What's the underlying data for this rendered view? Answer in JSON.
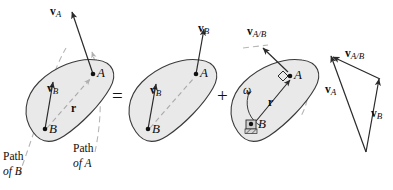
{
  "figure": {
    "background_color": "#ffffff",
    "body_fill_color": "#e9e9e9",
    "body_stroke_color": "#3a3a3a",
    "vector_color": "#2a2a2a",
    "dashed_guide_color": "#b6b6b6"
  },
  "operators": {
    "equals": "=",
    "plus": "+"
  },
  "panels": {
    "general_plane_motion": {
      "name": "general-plane-motion",
      "points": {
        "a_label": "A",
        "b_label": "B"
      },
      "vectors": {
        "v_a": {
          "symbol": "v",
          "subscript": "A"
        },
        "v_b": {
          "symbol": "v",
          "subscript": "B"
        },
        "r": {
          "symbol": "r"
        }
      },
      "annotations": {
        "path_of_a": "Path\nof A",
        "path_of_a_line1": "Path",
        "path_of_a_line2": "of A",
        "path_of_b_line1": "Path",
        "path_of_b_line2": "of B"
      }
    },
    "translation": {
      "name": "translation",
      "points": {
        "a_label": "A",
        "b_label": "B"
      },
      "vectors": {
        "v_b_at_a": {
          "symbol": "v",
          "subscript": "B"
        },
        "v_b_at_b": {
          "symbol": "v",
          "subscript": "B"
        }
      }
    },
    "rotation": {
      "name": "rotation-about-b",
      "points": {
        "a_label": "A",
        "b_label": "B"
      },
      "vectors": {
        "v_ab": {
          "symbol": "v",
          "subscript": "A/B"
        },
        "r": {
          "symbol": "r"
        }
      },
      "angular_velocity": {
        "symbol": "ω"
      },
      "support": "pin-support-at-b",
      "right_angle_marker": "right-angle-at-a"
    },
    "vector_triangle": {
      "name": "velocity-vector-triangle",
      "vectors": {
        "v_a": {
          "symbol": "v",
          "subscript": "A"
        },
        "v_b": {
          "symbol": "v",
          "subscript": "B"
        },
        "v_ab": {
          "symbol": "v",
          "subscript": "A/B"
        }
      }
    }
  },
  "labels": {
    "v_a_text": "v",
    "v_a_sub": "A",
    "v_b_text": "v",
    "v_b_sub": "B",
    "v_ab_text": "v",
    "v_ab_sub": "A/B",
    "r_text": "r",
    "omega_text": "ω",
    "point_a": "A",
    "point_b": "B",
    "path_word": "Path",
    "of_a": "of A",
    "of_b": "of B"
  }
}
